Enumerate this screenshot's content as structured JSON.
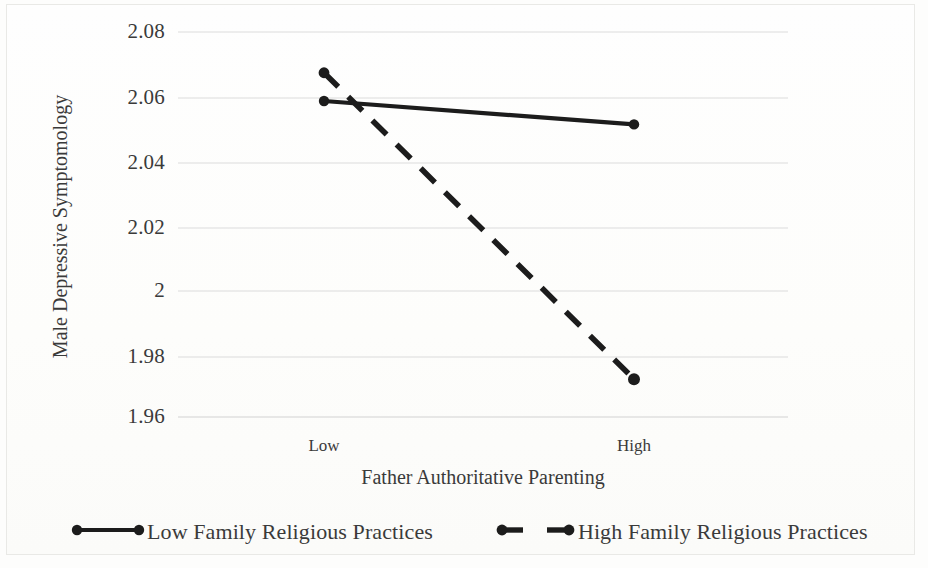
{
  "chart_data": {
    "type": "line",
    "title": "",
    "xlabel": "Father Authoritative Parenting",
    "ylabel": "Male Depressive Symptomology",
    "categories": [
      "Low",
      "High"
    ],
    "x_tick_labels": [
      "Low",
      "High"
    ],
    "y_tick_labels": [
      "2.08",
      "2.06",
      "2.04",
      "2.02",
      "2",
      "1.98",
      "1.96"
    ],
    "y_tick_values": [
      2.08,
      2.06,
      2.04,
      2.02,
      2.0,
      1.98,
      1.96
    ],
    "ylim": [
      1.96,
      2.08
    ],
    "grid": true,
    "grid_axis": "y",
    "legend_position": "bottom",
    "series": [
      {
        "name": "Low Family Religious Practices",
        "values": [
          2.0585,
          2.0512
        ],
        "style": "solid",
        "marker": "circle",
        "color": "#1c1c1c"
      },
      {
        "name": "High Family Religious Practices",
        "values": [
          2.0673,
          1.9718
        ],
        "style": "dashed",
        "marker": "circle",
        "color": "#1c1c1c"
      }
    ]
  },
  "axes": {
    "y_title": "Male Depressive Symptomology",
    "x_title": "Father Authoritative Parenting",
    "y_ticks": [
      {
        "label": "2.08",
        "y": 32
      },
      {
        "label": "2.06",
        "y": 98
      },
      {
        "label": "2.04",
        "y": 163
      },
      {
        "label": "2.02",
        "y": 228
      },
      {
        "label": "2",
        "y": 291
      },
      {
        "label": "1.98",
        "y": 357
      },
      {
        "label": "1.96",
        "y": 417
      }
    ],
    "x_ticks": [
      {
        "label": "Low",
        "x": 324
      },
      {
        "label": "High",
        "x": 634
      }
    ]
  },
  "legend": {
    "items": [
      {
        "label": "Low Family Religious Practices",
        "style": "solid"
      },
      {
        "label": "High Family Religious Practices",
        "style": "dashed"
      }
    ]
  },
  "colors": {
    "line": "#1c1c1c",
    "gridline": "#dddddd",
    "text": "#3a3a3a",
    "background": "#fdfdfc",
    "frame": "#e9e9e6"
  }
}
